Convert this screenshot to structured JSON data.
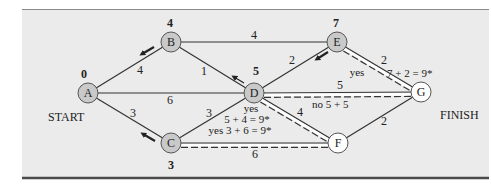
{
  "diagram": {
    "type": "shortest-path-network",
    "colors": {
      "panel_bg": "#ebebeb",
      "top_rule": "#8a8a8a",
      "bottom_rule": "#4a4a4a",
      "edge": "#333333",
      "solved_node_fill": "#c9c9c9",
      "unsolved_node_fill": "#ffffff",
      "text": "#222222"
    },
    "labels": {
      "start": "START",
      "finish": "FINISH"
    },
    "nodes": [
      {
        "id": "A",
        "label": "A",
        "x": 88,
        "y": 93,
        "value": "0",
        "vx": 84,
        "vy": 78,
        "solved": true
      },
      {
        "id": "B",
        "label": "B",
        "x": 171,
        "y": 42,
        "value": "4",
        "vx": 170,
        "vy": 27,
        "solved": true
      },
      {
        "id": "C",
        "label": "C",
        "x": 171,
        "y": 143,
        "value": "3",
        "vx": 171,
        "vy": 169,
        "solved": true
      },
      {
        "id": "D",
        "label": "D",
        "x": 254,
        "y": 93,
        "value": "5",
        "vx": 256,
        "vy": 75,
        "solved": true
      },
      {
        "id": "E",
        "label": "E",
        "x": 337,
        "y": 42,
        "value": "7",
        "vx": 336,
        "vy": 27,
        "solved": true
      },
      {
        "id": "F",
        "label": "F",
        "x": 338,
        "y": 143,
        "value": "",
        "vx": 0,
        "vy": 0,
        "solved": false
      },
      {
        "id": "G",
        "label": "G",
        "x": 421,
        "y": 92,
        "value": "",
        "vx": 0,
        "vy": 0,
        "solved": false
      }
    ],
    "edges": [
      {
        "from": "A",
        "to": "B",
        "weight": "4",
        "lx": 140,
        "ly": 74
      },
      {
        "from": "A",
        "to": "D",
        "weight": "6",
        "lx": 170,
        "ly": 104
      },
      {
        "from": "A",
        "to": "C",
        "weight": "3",
        "lx": 133,
        "ly": 117
      },
      {
        "from": "B",
        "to": "E",
        "weight": "4",
        "lx": 254,
        "ly": 39
      },
      {
        "from": "B",
        "to": "D",
        "weight": "1",
        "lx": 204,
        "ly": 75
      },
      {
        "from": "C",
        "to": "D",
        "weight": "3",
        "lx": 209,
        "ly": 117
      },
      {
        "from": "C",
        "to": "F",
        "weight": "6",
        "lx": 255,
        "ly": 158
      },
      {
        "from": "D",
        "to": "E",
        "weight": "2",
        "lx": 292,
        "ly": 64
      },
      {
        "from": "D",
        "to": "G",
        "weight": "5",
        "lx": 340,
        "ly": 89
      },
      {
        "from": "D",
        "to": "F",
        "weight": "4",
        "lx": 300,
        "ly": 116
      },
      {
        "from": "E",
        "to": "G",
        "weight": "2",
        "lx": 384,
        "ly": 64
      },
      {
        "from": "F",
        "to": "G",
        "weight": "2",
        "lx": 384,
        "ly": 125
      }
    ],
    "candidate_paths": [
      {
        "from": "E",
        "to": "G",
        "style": "double-dashed"
      },
      {
        "from": "D",
        "to": "G",
        "style": "double-dashed"
      },
      {
        "from": "D",
        "to": "F",
        "style": "double-dashed"
      },
      {
        "from": "C",
        "to": "F",
        "style": "double-dashed"
      }
    ],
    "annotations": [
      {
        "id": "eg-yes",
        "text": "yes",
        "x": 357,
        "y": 76,
        "size": 11
      },
      {
        "id": "g-total",
        "text": "7 + 2 = 9*",
        "x": 417,
        "y": 77,
        "size": 11
      },
      {
        "id": "dg-no",
        "text": "no  5 + 5",
        "x": 345,
        "y": 108,
        "size": 11
      },
      {
        "id": "df-yes",
        "text": "yes",
        "x": 251,
        "y": 112,
        "size": 11
      },
      {
        "id": "df-total",
        "text": "5 + 4 = 9*",
        "x": 247,
        "y": 123,
        "size": 11
      },
      {
        "id": "cf-total",
        "text": "yes  3 + 6 = 9*",
        "x": 240,
        "y": 134,
        "size": 11
      }
    ],
    "arrows": [
      {
        "id": "arrow-b-to-a",
        "x1": 154,
        "y1": 47,
        "x2": 142,
        "y2": 54,
        "thick": true
      },
      {
        "id": "arrow-c-to-a",
        "x1": 155,
        "y1": 141,
        "x2": 143,
        "y2": 134,
        "thick": true
      },
      {
        "id": "arrow-d-to-b",
        "x1": 244,
        "y1": 83,
        "x2": 234,
        "y2": 77,
        "thick": false
      },
      {
        "id": "arrow-e-to-d",
        "x1": 328,
        "y1": 52,
        "x2": 317,
        "y2": 59,
        "thick": true
      }
    ]
  }
}
